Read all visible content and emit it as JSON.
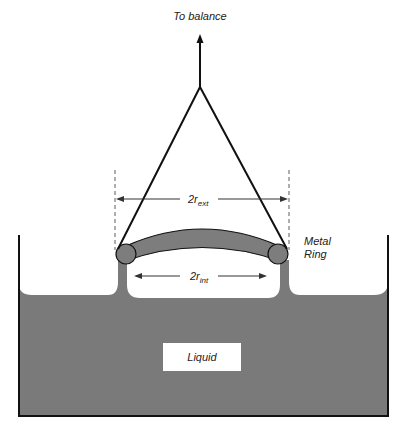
{
  "diagram": {
    "labels": {
      "to_balance": "To balance",
      "r_ext_prefix": "2r",
      "r_ext_sub": "ext",
      "r_int_prefix": "2r",
      "r_int_sub": "int",
      "metal_line1": "Metal",
      "metal_line2": "Ring",
      "liquid": "Liquid"
    },
    "colors": {
      "liquid": "#7a7a7a",
      "ring": "#7d7d7d",
      "line": "#111111",
      "background": "#ffffff"
    }
  }
}
